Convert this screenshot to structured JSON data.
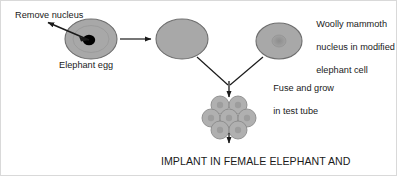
{
  "diagram": {
    "background_color": "#ffffff",
    "border_color": "#d9d9d9",
    "cell_fill_color": "#a8a8a8",
    "cell_stroke_color": "#6e6e6e",
    "nucleus_color": "#000000",
    "line_color": "#1a1a1a"
  },
  "labels": {
    "remove_nucleus": "Remove nucleus",
    "elephant_egg": "Elephant egg",
    "mammoth_nucleus_line1": "Woolly mammoth",
    "mammoth_nucleus_line2": "nucleus in modified",
    "mammoth_nucleus_line3": "elephant cell",
    "fuse_grow_line1": "Fuse and grow",
    "fuse_grow_line2": "in test tube",
    "implant_line1": "IMPLANT IN FEMALE ELEPHANT AND",
    "implant_line2": "AWAIT BIRTH OF WOOLLY MAMMOTH!"
  },
  "cells": {
    "elephant_egg": {
      "cx": 90,
      "cy": 38,
      "rx": 26,
      "ry": 20,
      "has_nucleus": true,
      "nucleus_style": "solid-black"
    },
    "enucleated_egg": {
      "cx": 181,
      "cy": 38,
      "rx": 26,
      "ry": 20,
      "has_nucleus": false
    },
    "modified_cell": {
      "cx": 278,
      "cy": 40,
      "rx": 23,
      "ry": 18,
      "has_nucleus": true,
      "nucleus_style": "faint-grey"
    },
    "cluster": {
      "cx": 228,
      "cy": 116,
      "count": 7,
      "rows": [
        2,
        3,
        2
      ],
      "cell_radius": 9
    }
  },
  "arrows": {
    "remove_nucleus_arrow": {
      "from": [
        88,
        39
      ],
      "to": [
        46,
        21
      ]
    },
    "transfer_arrow": {
      "from": [
        118,
        38
      ],
      "to": [
        152,
        38
      ]
    },
    "fuse_left_branch": {
      "from": [
        196,
        57
      ],
      "to": [
        228,
        85
      ]
    },
    "fuse_right_branch": {
      "from": [
        263,
        57
      ],
      "to": [
        228,
        85
      ]
    },
    "fuse_down_arrow": {
      "from": [
        228,
        78
      ],
      "to": [
        228,
        98
      ]
    },
    "implant_arrow": {
      "from": [
        228,
        130
      ],
      "to": [
        228,
        142
      ]
    }
  }
}
